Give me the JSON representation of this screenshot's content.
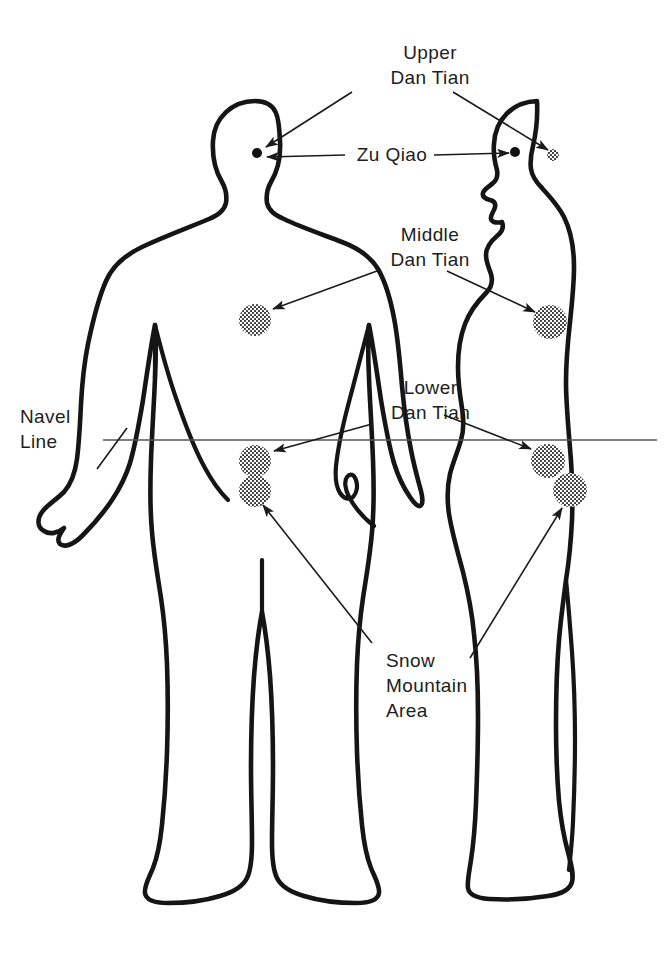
{
  "diagram": {
    "background_color": "#ffffff",
    "ink_color": "#1a1a1a",
    "navel_line_color": "#555555",
    "labels": {
      "upper_dan_tian": "Upper\nDan Tian",
      "zu_qiao": "Zu Qiao",
      "middle_dan_tian": "Middle\nDan Tian",
      "lower_dan_tian": "Lower\nDan Tian",
      "navel_line": "Navel\nLine",
      "snow_mountain_area": "Snow\nMountain\nArea"
    },
    "figures": [
      {
        "name": "front-view-figure",
        "orientation": "front",
        "markers": [
          {
            "point": "upper-dan-tian-zu-qiao",
            "style": "solid-dot",
            "x": 257,
            "y": 153,
            "r": 5
          },
          {
            "point": "middle-dan-tian",
            "style": "stippled-circle",
            "x": 255,
            "y": 320,
            "r": 16
          },
          {
            "point": "lower-dan-tian",
            "style": "stippled-circle",
            "x": 255,
            "y": 461,
            "r": 16
          },
          {
            "point": "snow-mountain-area",
            "style": "stippled-circle",
            "x": 255,
            "y": 491,
            "r": 16
          }
        ]
      },
      {
        "name": "side-view-figure",
        "orientation": "profile",
        "markers": [
          {
            "point": "zu-qiao",
            "style": "solid-dot",
            "x": 515,
            "y": 152,
            "r": 5
          },
          {
            "point": "upper-dan-tian",
            "style": "stippled-circle",
            "x": 553,
            "y": 155,
            "r": 6
          },
          {
            "point": "middle-dan-tian",
            "style": "stippled-circle",
            "x": 550,
            "y": 322,
            "r": 17
          },
          {
            "point": "lower-dan-tian",
            "style": "stippled-circle",
            "x": 548,
            "y": 461,
            "r": 17
          },
          {
            "point": "snow-mountain-area",
            "style": "stippled-circle",
            "x": 570,
            "y": 490,
            "r": 17
          }
        ]
      }
    ],
    "navel_line": {
      "x1": 103,
      "x2": 657,
      "y": 440
    }
  }
}
